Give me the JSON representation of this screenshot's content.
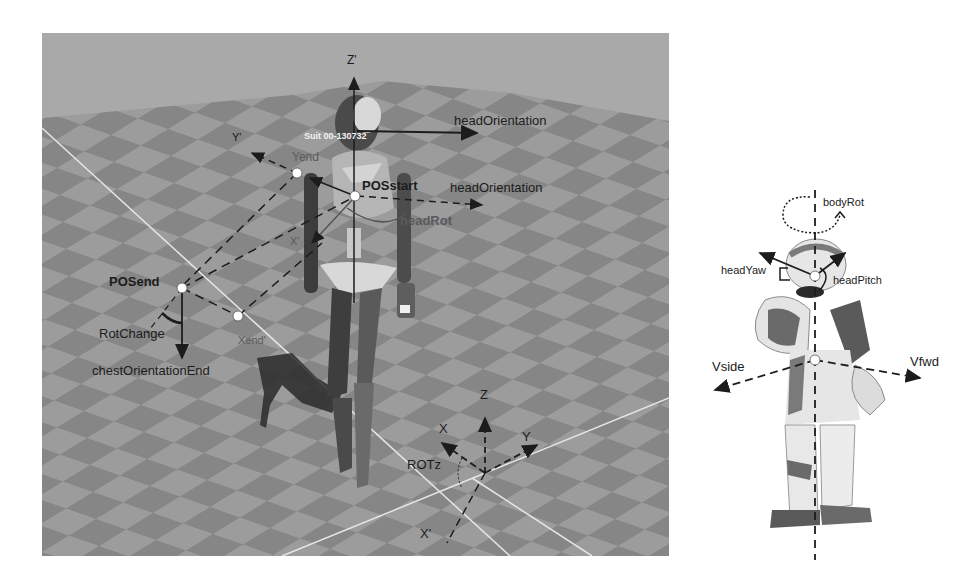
{
  "left_panel": {
    "description": "3D simulation of walking mannequin on checkered floor with coordinate frames",
    "suit_label": "Suit 00-130732",
    "labels": {
      "z_prime": "Z'",
      "head_orientation_top": "headOrientation",
      "head_orientation_mid": "headOrientation",
      "y_prime": "Y'",
      "y_end": "Yend",
      "pos_start": "POSstart",
      "head_rot": "headRot",
      "x_prime_upper": "X'",
      "pos_end": "POSend",
      "rot_change": "RotChange",
      "x_end": "Xend'",
      "chest_orientation_end": "chestOrientationEnd",
      "z": "Z",
      "x": "X",
      "y": "Y",
      "rot_z": "ROTz",
      "x_prime_lower": "X'"
    },
    "colors": {
      "sky": "#a9a9a9",
      "floor_light": "#9c9c9c",
      "floor_dark": "#858585",
      "grid_line": "#e6e6e6",
      "annotation": "#1c1c1c"
    }
  },
  "right_panel": {
    "description": "Humanoid Nao robot with control axes",
    "labels": {
      "body_rot": "bodyRot",
      "head_yaw": "headYaw",
      "head_pitch": "headPitch",
      "v_side": "Vside",
      "v_fwd": "Vfwd"
    }
  }
}
